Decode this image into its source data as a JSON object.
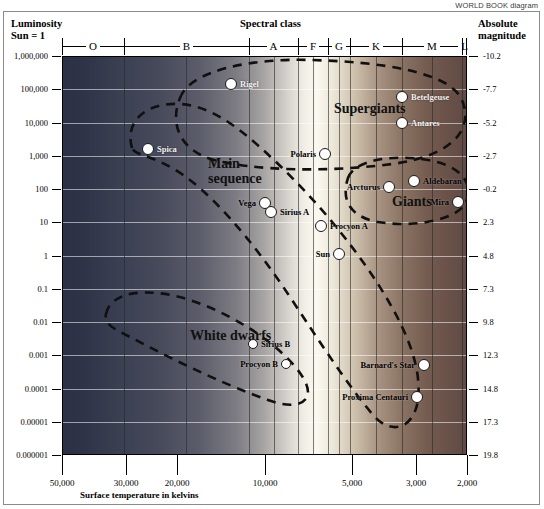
{
  "credit": "WORLD BOOK diagram",
  "header": {
    "luminosity_title": "Luminosity",
    "luminosity_sub": "Sun = 1",
    "spectral_title": "Spectral class",
    "absmag_title": "Absolute",
    "absmag_sub": "magnitude"
  },
  "xaxis_title": "Surface temperature in kelvins",
  "chart_data": {
    "type": "scatter",
    "xlabel": "Surface temperature in kelvins",
    "ylabel": "Luminosity (Sun = 1)",
    "y2label": "Absolute magnitude",
    "grid": true,
    "legend": "none",
    "xscale": "log-reversed",
    "yscale": "log",
    "xlim": [
      50000,
      2000
    ],
    "ylim": [
      1e-06,
      1000000
    ],
    "y_ticklabels": [
      "1,000,000",
      "100,000",
      "10,000",
      "1,000",
      "100",
      "10",
      "1",
      "0.1",
      "0.01",
      "0.001",
      "0.0001",
      "0.00001",
      "0.000001"
    ],
    "y2_ticklabels": [
      "-10.2",
      "-7.7",
      "-5.2",
      "-2.7",
      "-0.2",
      "2.3",
      "4.8",
      "7.3",
      "9.8",
      "12.3",
      "14.8",
      "17.3",
      "19.8"
    ],
    "x_ticklabels": [
      "50,000",
      "30,000",
      "20,000",
      "10,000",
      "5,000",
      "3,000",
      "2,000"
    ],
    "spectral_classes": [
      {
        "label": "O",
        "x_start": 0,
        "x_end": 62
      },
      {
        "label": "B",
        "x_start": 62,
        "x_end": 187
      },
      {
        "label": "A",
        "x_start": 187,
        "x_end": 236
      },
      {
        "label": "F",
        "x_start": 236,
        "x_end": 266
      },
      {
        "label": "G",
        "x_start": 266,
        "x_end": 288
      },
      {
        "label": "K",
        "x_start": 288,
        "x_end": 340
      },
      {
        "label": "M",
        "x_start": 340,
        "x_end": 400
      },
      {
        "label": "L",
        "x_start": 400,
        "x_end": 405
      }
    ],
    "regions": [
      {
        "name": "Supergiants",
        "x": 272,
        "y": 45,
        "size": 14,
        "color": "#111111"
      },
      {
        "name": "Main\nsequence",
        "x": 146,
        "y": 100,
        "size": 14,
        "color": "#111111"
      },
      {
        "name": "Giants",
        "x": 330,
        "y": 138,
        "size": 14,
        "color": "#111111"
      },
      {
        "name": "White dwarfs",
        "x": 128,
        "y": 272,
        "size": 14,
        "color": "#111111"
      }
    ],
    "stars": [
      {
        "name": "Rigel",
        "x": 169,
        "y": 28,
        "r": 6,
        "label_side": "right",
        "tone": "light"
      },
      {
        "name": "Betelgeuse",
        "x": 340,
        "y": 41,
        "r": 6,
        "label_side": "right",
        "tone": "light"
      },
      {
        "name": "Antares",
        "x": 340,
        "y": 67,
        "r": 6,
        "label_side": "right",
        "tone": "light"
      },
      {
        "name": "Spica",
        "x": 86,
        "y": 93,
        "r": 6,
        "label_side": "right",
        "tone": "light"
      },
      {
        "name": "Polaris",
        "x": 263,
        "y": 98,
        "r": 6,
        "label_side": "left",
        "tone": "dark"
      },
      {
        "name": "Arcturus",
        "x": 327,
        "y": 131,
        "r": 6,
        "label_side": "left",
        "tone": "dark"
      },
      {
        "name": "Aldebaran",
        "x": 352,
        "y": 125,
        "r": 6,
        "label_side": "right",
        "tone": "dark"
      },
      {
        "name": "Mira",
        "x": 396,
        "y": 146,
        "r": 6,
        "label_side": "left",
        "tone": "dark"
      },
      {
        "name": "Vega",
        "x": 203,
        "y": 147,
        "r": 6,
        "label_side": "left",
        "tone": "dark"
      },
      {
        "name": "Sirius A",
        "x": 209,
        "y": 156,
        "r": 6,
        "label_side": "right",
        "tone": "dark"
      },
      {
        "name": "Procyon A",
        "x": 259,
        "y": 170,
        "r": 6,
        "label_side": "right",
        "tone": "dark"
      },
      {
        "name": "Sun",
        "x": 277,
        "y": 198,
        "r": 6,
        "label_side": "left",
        "tone": "dark"
      },
      {
        "name": "Sirius B",
        "x": 191,
        "y": 288,
        "r": 5,
        "label_side": "right",
        "tone": "dark"
      },
      {
        "name": "Procyon B",
        "x": 224,
        "y": 308,
        "r": 5,
        "label_side": "left",
        "tone": "dark"
      },
      {
        "name": "Barnard's Star",
        "x": 362,
        "y": 309,
        "r": 6,
        "label_side": "left",
        "tone": "dark"
      },
      {
        "name": "Proxima Centauri",
        "x": 355,
        "y": 341,
        "r": 6,
        "label_side": "left",
        "tone": "dark"
      }
    ]
  }
}
